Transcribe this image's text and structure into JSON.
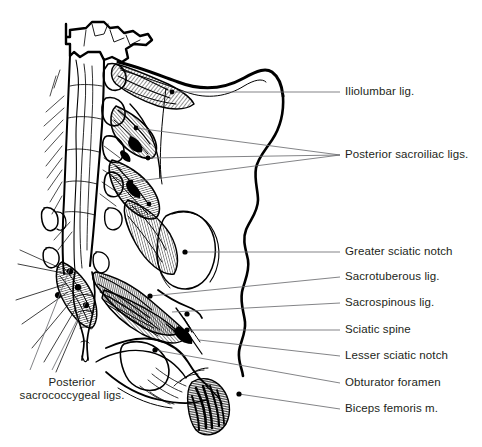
{
  "figure": {
    "ink_color": "#000000",
    "leader_color": "#58595b",
    "text_color": "#231f20",
    "background": "#ffffff"
  },
  "labels": {
    "iliolumbar": "Iliolumbar lig.",
    "posterior_sacroiliac": "Posterior sacroiliac ligs.",
    "greater_sciatic_notch": "Greater sciatic notch",
    "sacrotuberous": "Sacrotuberous lig.",
    "sacrospinous": "Sacrospinous lig.",
    "sciatic_spine": "Sciatic spine",
    "lesser_sciatic_notch": "Lesser sciatic notch",
    "obturator_foramen": "Obturator foramen",
    "biceps_femoris": "Biceps femoris m.",
    "posterior_sacrococcygeal": "Posterior sacrococcygeal ligs."
  }
}
